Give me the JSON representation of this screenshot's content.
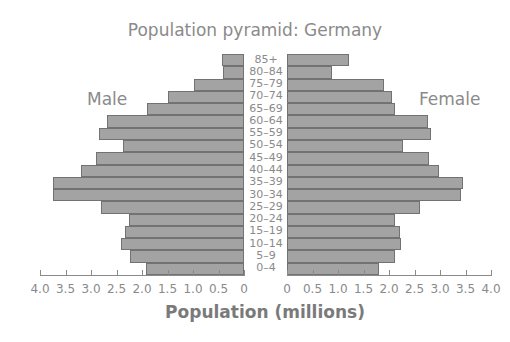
{
  "chart_data": {
    "type": "bar",
    "title": "Population pyramid: Germany",
    "xlabel": "Population (millions)",
    "ylabel": "",
    "orientation": "horizontal-pyramid",
    "categories": [
      "85+",
      "80–84",
      "75–79",
      "70–74",
      "65–69",
      "60–64",
      "55–59",
      "50–54",
      "45–49",
      "40–44",
      "35–39",
      "30–34",
      "25–29",
      "20–24",
      "15–19",
      "10–14",
      "5–9",
      "0–4"
    ],
    "series": [
      {
        "name": "Male",
        "values": [
          0.43,
          0.41,
          0.98,
          1.49,
          1.9,
          2.69,
          2.84,
          2.37,
          2.9,
          3.2,
          3.75,
          3.75,
          2.8,
          2.26,
          2.33,
          2.41,
          2.24,
          1.92
        ]
      },
      {
        "name": "Female",
        "values": [
          1.22,
          0.88,
          1.9,
          2.06,
          2.12,
          2.76,
          2.82,
          2.27,
          2.78,
          2.98,
          3.45,
          3.41,
          2.61,
          2.12,
          2.22,
          2.24,
          2.12,
          1.8
        ]
      }
    ],
    "xlim": [
      0,
      4.0
    ],
    "left_ticks": [
      "4.0",
      "3.5",
      "3.0",
      "2.5",
      "2.0",
      "1.5",
      "1.0",
      "0.5",
      "0"
    ],
    "right_ticks": [
      "0",
      "0.5",
      "1.0",
      "1.5",
      "2.0",
      "2.5",
      "3.0",
      "3.5",
      "4.0"
    ],
    "grid": false,
    "legend": "side labels (Male left, Female right)"
  },
  "labels": {
    "title": "Population pyramid: Germany",
    "male": "Male",
    "female": "Female",
    "xlabel": "Population (millions)"
  },
  "colors": {
    "bar_fill": "#a3a3a3",
    "bar_border": "#727272",
    "text": "#8a8a8a"
  }
}
